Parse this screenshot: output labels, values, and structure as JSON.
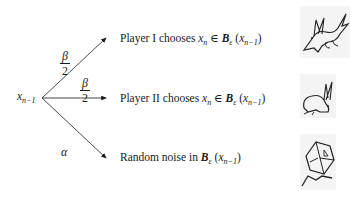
{
  "diagram": {
    "root_node": {
      "var": "x",
      "sub": "n−1"
    },
    "edges": [
      {
        "id": "player1",
        "prob_num": "β",
        "prob_den": "2",
        "outcome": {
          "prefix": "Player I chooses ",
          "var": "x",
          "var_sub": "n",
          "rel": " ∈ ",
          "set": "B",
          "set_sub": "ε",
          "arg_open": " (",
          "arg_var": "x",
          "arg_sub": "n−1",
          "arg_close": ")"
        },
        "icon": "fox-icon"
      },
      {
        "id": "player2",
        "prob_num": "β",
        "prob_den": "2",
        "outcome": {
          "prefix": "Player II chooses ",
          "var": "x",
          "var_sub": "n",
          "rel": " ∈ ",
          "set": "B",
          "set_sub": "ε",
          "arg_open": " (",
          "arg_var": "x",
          "arg_sub": "n−1",
          "arg_close": ")"
        },
        "icon": "rabbit-icon"
      },
      {
        "id": "noise",
        "prob": "α",
        "outcome": {
          "prefix": "Random noise in ",
          "set": "B",
          "set_sub": "ε",
          "arg_open": " (",
          "arg_var": "x",
          "arg_sub": "n−1",
          "arg_close": ")"
        },
        "icon": "die-icon"
      }
    ]
  }
}
